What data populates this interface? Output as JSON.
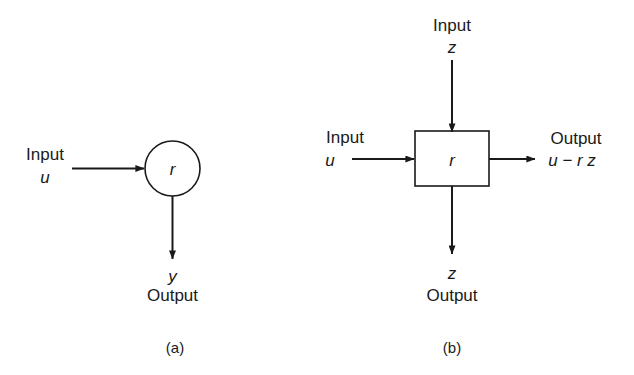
{
  "figure": {
    "background_color": "#ffffff",
    "stroke_color": "#1a1a1a",
    "panels": [
      {
        "tag": "(a)",
        "node_label": "r",
        "node_shape": "circle",
        "input_word": "Input",
        "input_symbol": "u",
        "output_symbol": "y",
        "output_word": "Output"
      },
      {
        "tag": "(b)",
        "node_label": "r",
        "node_shape": "square",
        "top_input_word": "Input",
        "top_input_symbol": "z",
        "left_input_word": "Input",
        "left_input_symbol": "u",
        "right_output_word": "Output",
        "right_output_expression": "u − r z",
        "bottom_output_symbol": "z",
        "bottom_output_word": "Output"
      }
    ]
  }
}
